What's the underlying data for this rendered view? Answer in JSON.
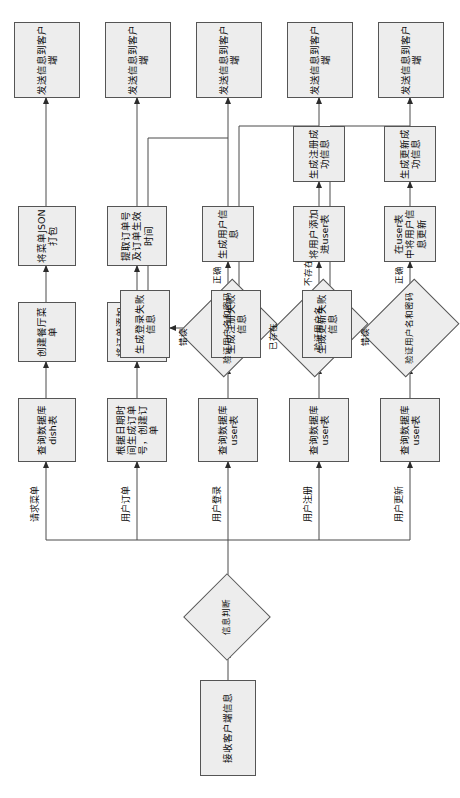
{
  "diagram": {
    "orientation": "rotated-90",
    "start": {
      "label": "接收客户端信息"
    },
    "decision": {
      "label": "信息判断"
    },
    "branches": [
      {
        "key": "menu",
        "edge_label": "请求菜单",
        "nodes": [
          "查询数据库dish表",
          "创建餐厅菜单",
          "将菜单JSON打包"
        ],
        "end": "发送信息到客户端"
      },
      {
        "key": "order",
        "edge_label": "用户订单",
        "nodes": [
          "根据日期时间生成订单号，创建订单",
          "将订单添加进数据库orderItem和order表",
          "提取订单号及订单生效时间"
        ],
        "end": "发送信息到客户端"
      },
      {
        "key": "login",
        "edge_label": "用户登录",
        "query": "查询数据库user表",
        "decision": "验证用户名和密码",
        "branch_fail_label": "错误",
        "branch_ok_label": "正确",
        "fail_node": "生成登录失败信息",
        "ok_nodes": [
          "生成用户信息"
        ],
        "end": "发送信息到客户端"
      },
      {
        "key": "register",
        "edge_label": "用户注册",
        "query": "查询数据库user表",
        "decision": "验证用户名",
        "branch_fail_label": "已存在",
        "branch_ok_label": "不存在",
        "fail_node": "生成注册失败信息",
        "ok_nodes": [
          "将用户添加进user表",
          "生成注册成功信息"
        ],
        "end": "发送信息到客户端"
      },
      {
        "key": "update",
        "edge_label": "用户更新",
        "query": "查询数据库user表",
        "decision": "验证用户名和密码",
        "branch_fail_label": "错误",
        "branch_ok_label": "正确",
        "fail_node": "生成更新失败信息",
        "ok_nodes": [
          "在user表中将用户信息更新",
          "生成更新成功信息"
        ],
        "end": "发送信息到客户端"
      }
    ],
    "colors": {
      "node_fill": "#ededed",
      "node_stroke": "#555555",
      "line": "#4a4a4a",
      "text": "#0b0b0b",
      "background": "#ffffff"
    }
  }
}
